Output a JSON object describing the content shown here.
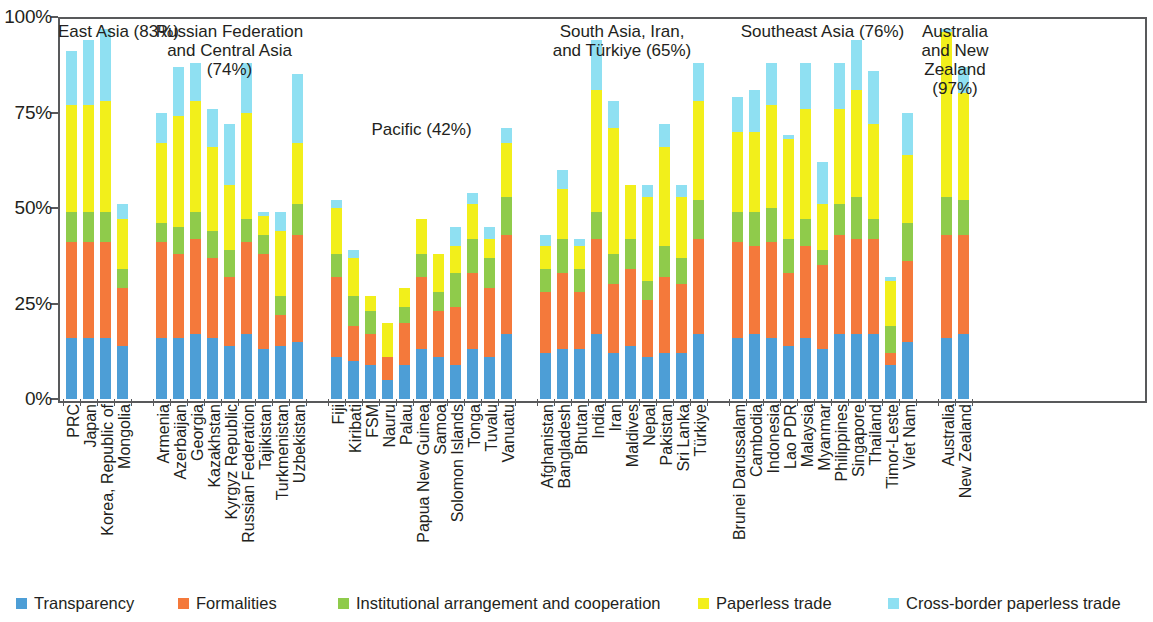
{
  "chart_data": {
    "type": "bar",
    "stacked": true,
    "title": "",
    "subtitle": "",
    "xlabel": "",
    "ylabel": "",
    "ylim": [
      0,
      100
    ],
    "y_ticks": [
      "0%",
      "25%",
      "50%",
      "75%",
      "100%"
    ],
    "y_tick_values": [
      0,
      25,
      50,
      75,
      100
    ],
    "grid": false,
    "legend_position": "bottom",
    "series": [
      {
        "name": "Transparency",
        "color": "#4d9ed6"
      },
      {
        "name": "Formalities",
        "color": "#f4793b"
      },
      {
        "name": "Institutional arrangement and cooperation",
        "color": "#8fcb4b"
      },
      {
        "name": "Paperless trade",
        "color": "#f2ef1b"
      },
      {
        "name": "Cross-border paperless trade",
        "color": "#8fe0f2"
      }
    ],
    "groups": [
      {
        "name": "East Asia",
        "label": "East Asia (83%)",
        "value": 83,
        "categories": [
          "PRC",
          "Japan",
          "Korea, Republic of",
          "Mongolia"
        ],
        "values": [
          [
            16,
            25,
            8,
            28,
            14
          ],
          [
            16,
            25,
            8,
            28,
            17
          ],
          [
            16,
            25,
            8,
            29,
            19
          ],
          [
            14,
            15,
            5,
            13,
            4
          ]
        ]
      },
      {
        "name": "Russian Federation and Central Asia",
        "label": "Russian Federation\nand Central Asia\n(74%)",
        "value": 74,
        "categories": [
          "Armenia",
          "Azerbaijan",
          "Georgia",
          "Kazakhstan",
          "Kyrgyz Republic",
          "Russian Federation",
          "Tajikistan",
          "Turkmenistan",
          "Uzbekistan"
        ],
        "values": [
          [
            16,
            25,
            5,
            21,
            8
          ],
          [
            16,
            22,
            7,
            29,
            13
          ],
          [
            17,
            25,
            7,
            29,
            10
          ],
          [
            16,
            21,
            7,
            22,
            10
          ],
          [
            14,
            18,
            7,
            17,
            16
          ],
          [
            17,
            24,
            6,
            28,
            13
          ],
          [
            13,
            25,
            5,
            5,
            1
          ],
          [
            14,
            8,
            5,
            17,
            5
          ],
          [
            15,
            28,
            8,
            16,
            18
          ]
        ]
      },
      {
        "name": "Pacific",
        "label": "Pacific (42%)",
        "value": 42,
        "categories": [
          "Fiji",
          "Kiribati",
          "FSM",
          "Nauru",
          "Palau",
          "Papua New Guinea",
          "Samoa",
          "Solomon Islands",
          "Tonga",
          "Tuvalu",
          "Vanuatu"
        ],
        "values": [
          [
            11,
            21,
            6,
            12,
            2
          ],
          [
            10,
            9,
            8,
            10,
            2
          ],
          [
            9,
            8,
            6,
            4,
            0
          ],
          [
            5,
            6,
            0,
            9,
            0
          ],
          [
            9,
            11,
            4,
            5,
            0
          ],
          [
            13,
            19,
            6,
            9,
            0
          ],
          [
            11,
            12,
            5,
            10,
            0
          ],
          [
            9,
            15,
            9,
            7,
            5
          ],
          [
            13,
            20,
            9,
            9,
            3
          ],
          [
            11,
            18,
            8,
            5,
            3
          ],
          [
            17,
            26,
            10,
            14,
            4
          ]
        ]
      },
      {
        "name": "South Asia, Iran, and Turkiye",
        "label": "South Asia, Iran,\nand Türkiye (65%)",
        "value": 65,
        "categories": [
          "Afghanistan",
          "Bangladesh",
          "Bhutan",
          "India",
          "Iran",
          "Maldives",
          "Nepal",
          "Pakistan",
          "Sri Lanka",
          "Türkiye"
        ],
        "values": [
          [
            12,
            16,
            6,
            6,
            3
          ],
          [
            13,
            20,
            9,
            13,
            5
          ],
          [
            13,
            15,
            6,
            6,
            2
          ],
          [
            17,
            25,
            7,
            32,
            13
          ],
          [
            12,
            18,
            8,
            33,
            7
          ],
          [
            14,
            20,
            8,
            14,
            0
          ],
          [
            11,
            15,
            5,
            22,
            3
          ],
          [
            12,
            20,
            8,
            26,
            6
          ],
          [
            12,
            18,
            7,
            16,
            3
          ],
          [
            17,
            25,
            10,
            26,
            10
          ]
        ]
      },
      {
        "name": "Southeast Asia",
        "label": "Southeast Asia (76%)",
        "value": 76,
        "categories": [
          "Brunei Darussalam",
          "Cambodia",
          "Indonesia",
          "Lao PDR",
          "Malaysia",
          "Myanmar",
          "Philippines",
          "Singapore",
          "Thailand",
          "Timor-Leste",
          "Viet Nam"
        ],
        "values": [
          [
            16,
            25,
            8,
            21,
            9
          ],
          [
            17,
            23,
            9,
            21,
            11
          ],
          [
            16,
            25,
            9,
            27,
            11
          ],
          [
            14,
            19,
            9,
            26,
            1
          ],
          [
            16,
            24,
            7,
            29,
            12
          ],
          [
            13,
            22,
            4,
            12,
            11
          ],
          [
            17,
            26,
            8,
            25,
            12
          ],
          [
            17,
            25,
            11,
            28,
            13
          ],
          [
            17,
            25,
            5,
            25,
            14
          ],
          [
            9,
            3,
            7,
            12,
            1
          ],
          [
            15,
            21,
            10,
            18,
            11
          ]
        ]
      },
      {
        "name": "Australia and New Zealand",
        "label": "Australia\nand New\nZealand\n(97%)",
        "value": 97,
        "categories": [
          "Australia",
          "New Zealand"
        ],
        "values": [
          [
            16,
            27,
            10,
            43,
            1
          ],
          [
            17,
            26,
            9,
            28,
            7
          ]
        ]
      }
    ]
  },
  "legend": {
    "items": [
      {
        "label": "Transparency",
        "color": "#4d9ed6",
        "icon": "legend-swatch-icon"
      },
      {
        "label": "Formalities",
        "color": "#f4793b",
        "icon": "legend-swatch-icon"
      },
      {
        "label": "Institutional arrangement and cooperation",
        "color": "#8fcb4b",
        "icon": "legend-swatch-icon"
      },
      {
        "label": "Paperless trade",
        "color": "#f2ef1b",
        "icon": "legend-swatch-icon"
      },
      {
        "label": "Cross-border paperless trade",
        "color": "#8fe0f2",
        "icon": "legend-swatch-icon"
      }
    ]
  }
}
